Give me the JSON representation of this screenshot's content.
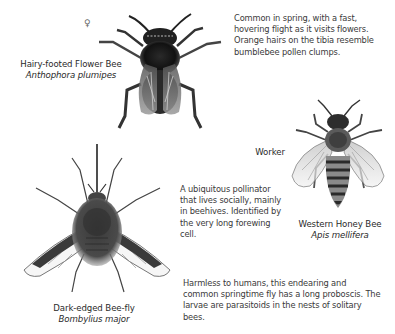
{
  "specimens": [
    {
      "common_name": "Hairy-footed Flower Bee",
      "scientific_name": "Anthophora plumipes",
      "sex_symbol": "♀",
      "description": "Common in spring, with a fast, hovering flight as it visits flowers. Orange hairs on the tibia resemble bumblebee pollen clumps.",
      "icon": "hairy-footed-flower-bee-illustration"
    },
    {
      "common_name": "Western Honey Bee",
      "scientific_name": "Apis mellifera",
      "caste": "Worker",
      "description": "A ubiquitous pollinator that lives socially, mainly in beehives. Identified by the very long forewing cell.",
      "icon": "honey-bee-illustration"
    },
    {
      "common_name": "Dark-edged Bee-fly",
      "scientific_name": "Bombylius major",
      "description": "Harmless to humans, this endearing and common springtime fly has a long proboscis. The larvae are parasitoids in the nests of solitary bees.",
      "icon": "bee-fly-illustration"
    }
  ],
  "colors": {
    "background": "#ffffff",
    "text": "#2e2e2e",
    "ink_dark": "#1c1c1c",
    "ink_mid": "#6a6a6a",
    "ink_light": "#bdbdbd"
  }
}
